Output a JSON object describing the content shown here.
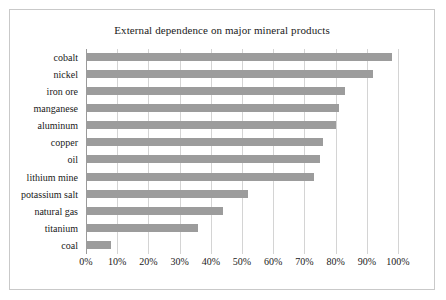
{
  "chart_data": {
    "type": "bar",
    "orientation": "horizontal",
    "title": "External dependence on major mineral products",
    "xlabel": "",
    "ylabel": "",
    "categories": [
      "cobalt",
      "nickel",
      "iron ore",
      "manganese",
      "aluminum",
      "copper",
      "oil",
      "lithium mine",
      "potassium salt",
      "natural gas",
      "titanium",
      "coal"
    ],
    "values": [
      98,
      92,
      83,
      81,
      80,
      76,
      75,
      73,
      52,
      44,
      36,
      8
    ],
    "xlim": [
      0,
      100
    ],
    "xticks": [
      0,
      10,
      20,
      30,
      40,
      50,
      60,
      70,
      80,
      90,
      100
    ],
    "xtick_labels": [
      "0%",
      "10%",
      "20%",
      "30%",
      "40%",
      "50%",
      "60%",
      "70%",
      "80%",
      "90%",
      "100%"
    ],
    "grid": true,
    "legend": false,
    "bar_color": "#9c9c9c",
    "plot_border_color": "#c9c9c9",
    "axis_color": "#9a9a9a",
    "gridline_color": "#d4d4d4",
    "text_color": "#1a1a1a"
  }
}
